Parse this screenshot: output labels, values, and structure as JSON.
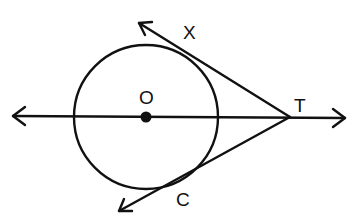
{
  "figure": {
    "labels": {
      "center": "O",
      "upper_tangent_point": "X",
      "external_point": "T",
      "lower_tangent_point": "C"
    },
    "colors": {
      "stroke": "#111111",
      "background": "#ffffff"
    },
    "geometry": {
      "circle": {
        "cx": 146,
        "cy": 117,
        "r": 72
      },
      "center_point": {
        "x": 146,
        "y": 117
      },
      "external_point": {
        "x": 290,
        "y": 117
      },
      "line_OT": {
        "x1": 12,
        "y1": 115,
        "x2": 346,
        "y2": 118
      },
      "tangent_upper": {
        "from": [
          290,
          117
        ],
        "to": [
          137,
          22
        ]
      },
      "tangent_lower": {
        "from": [
          290,
          117
        ],
        "to": [
          118,
          212
        ]
      }
    }
  }
}
